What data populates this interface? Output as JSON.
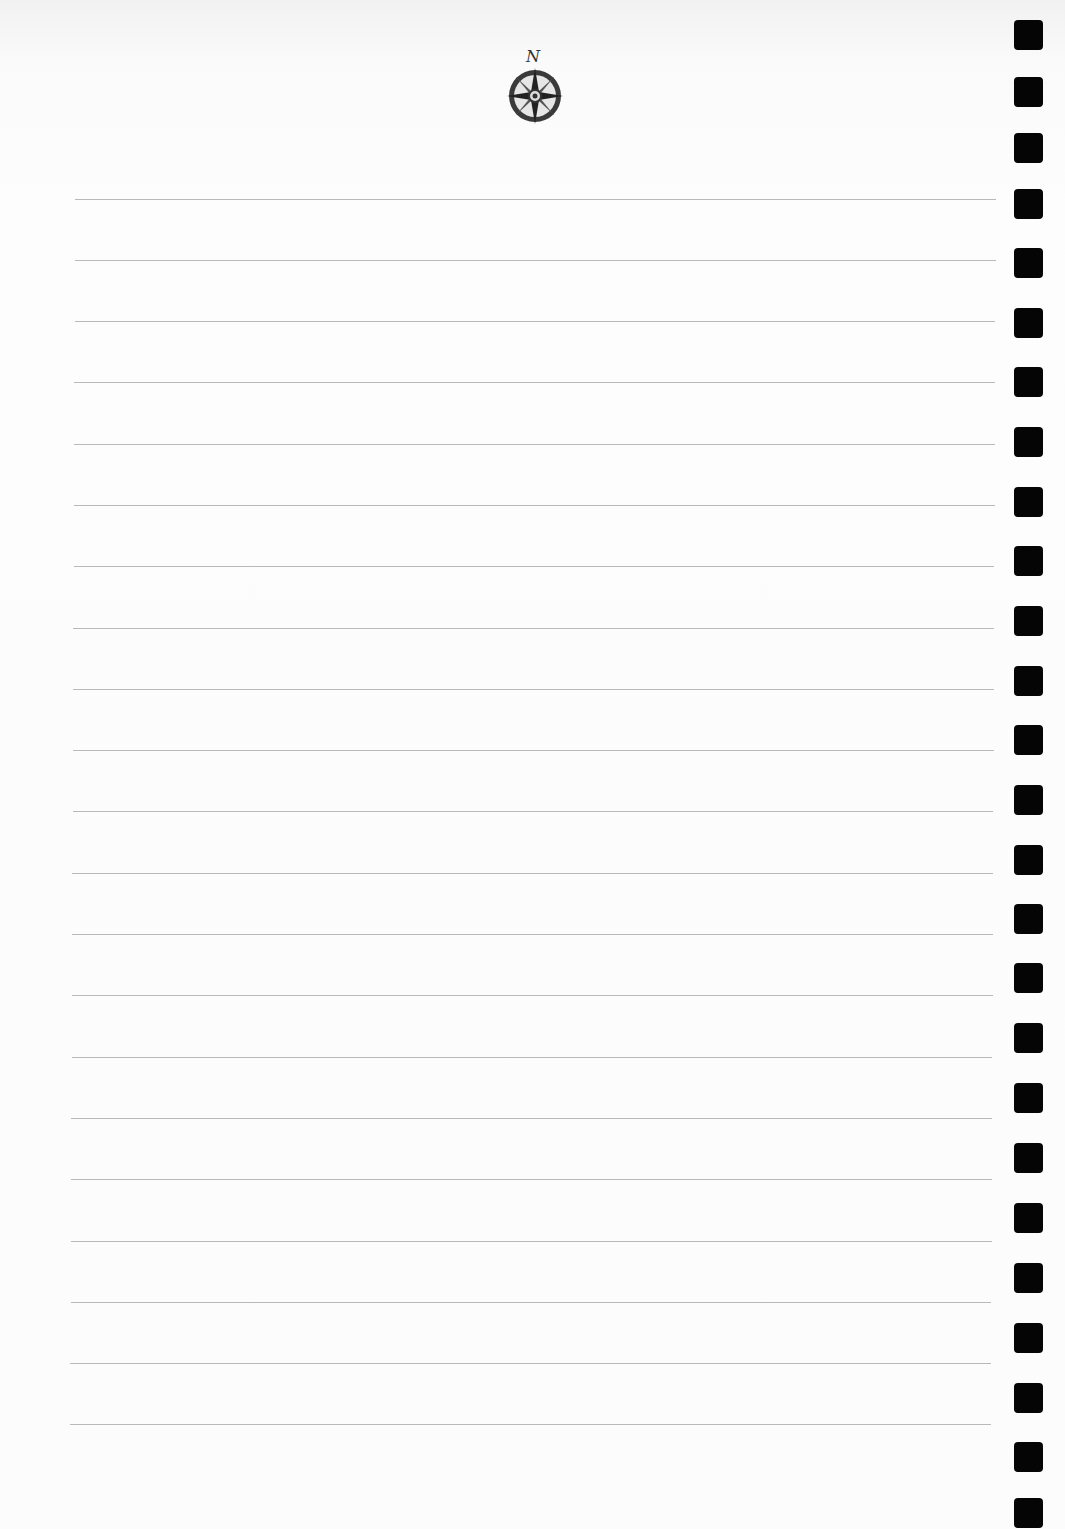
{
  "document": {
    "type": "lined-notebook-page",
    "header_emblem": {
      "icon": "compass-rose-icon",
      "letter": "N"
    },
    "ruled_lines": {
      "count": 21,
      "color": "#b9b9b9",
      "y_positions": [
        199,
        260,
        321,
        382,
        444,
        505,
        566,
        628,
        689,
        750,
        811,
        873,
        934,
        995,
        1057,
        1118,
        1179,
        1241,
        1302,
        1363,
        1424
      ]
    },
    "binding_holes": {
      "count": 24,
      "color": "#050505",
      "y_positions": [
        20,
        77,
        133,
        189,
        248,
        308,
        367,
        427,
        487,
        546,
        606,
        666,
        725,
        785,
        845,
        904,
        963,
        1023,
        1083,
        1143,
        1203,
        1263,
        1323,
        1383,
        1442,
        1498
      ]
    }
  }
}
